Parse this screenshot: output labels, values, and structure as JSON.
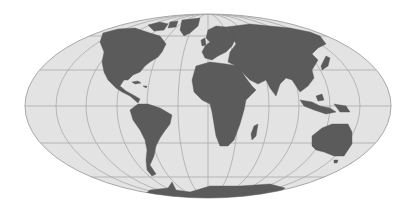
{
  "map": {
    "title": "World map (Mollweide projection)",
    "projection": "Mollweide",
    "colors": {
      "background": "#ffffff",
      "ocean": "#e3e3e3",
      "land": "#5b5b5b",
      "graticule": "#a9a9a9",
      "outline": "#a8a8a8"
    },
    "graticule": {
      "parallels_deg": [
        -60,
        -30,
        0,
        30,
        60
      ],
      "meridians_deg": [
        -150,
        -120,
        -90,
        -60,
        -30,
        0,
        30,
        60,
        90,
        120,
        150
      ]
    },
    "continents": [
      "North America",
      "South America",
      "Europe",
      "Africa",
      "Asia",
      "Australia",
      "Antarctica",
      "Greenland"
    ]
  }
}
